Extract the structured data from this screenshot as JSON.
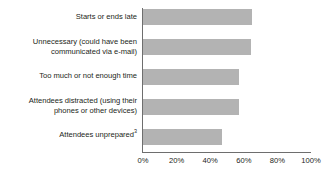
{
  "chart_data": {
    "type": "bar",
    "orientation": "horizontal",
    "title": "",
    "xlabel": "",
    "ylabel": "",
    "xlim": [
      0,
      100
    ],
    "grid": false,
    "legend": false,
    "tick_labels": [
      "0%",
      "20%",
      "40%",
      "60%",
      "80%",
      "100%"
    ],
    "tick_values": [
      0,
      20,
      40,
      60,
      80,
      100
    ],
    "categories": [
      "Starts or ends late",
      "Unnecessary (could have been communicated via e-mail)",
      "Too much or not enough time",
      "Attendees distracted (using their phones or other devices)",
      "Attendees unprepared"
    ],
    "values": [
      65,
      64,
      57,
      57,
      47
    ],
    "bar_color": "#b3b3b3",
    "axis_color": "#6e6e6e",
    "text_color": "#231f20",
    "items": [
      {
        "line1": "Starts or ends late",
        "line2": "",
        "footnote": "",
        "value": 65
      },
      {
        "line1": "Unnecessary (could have been",
        "line2": "communicated via e-mail)",
        "footnote": "",
        "value": 64
      },
      {
        "line1": "Too much or not enough time",
        "line2": "",
        "footnote": "",
        "value": 57
      },
      {
        "line1": "Attendees distracted (using their",
        "line2": "phones or other devices)",
        "footnote": "",
        "value": 57
      },
      {
        "line1": "Attendees unprepared",
        "line2": "",
        "footnote": "3",
        "value": 47
      }
    ]
  }
}
